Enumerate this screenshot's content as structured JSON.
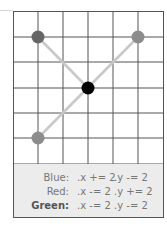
{
  "grid": {
    "columns": 6,
    "rows": 6,
    "line_color": "#555555",
    "background": "#ffffff"
  },
  "points": [
    {
      "name": "Blue",
      "col": 1,
      "row": 1,
      "color": "#666666"
    },
    {
      "name": "Red",
      "col": 5,
      "row": 1,
      "color": "#8c8c8c"
    },
    {
      "name": "Center",
      "col": 3,
      "row": 3,
      "color": "#000000"
    },
    {
      "name": "Green",
      "col": 1,
      "row": 5,
      "color": "#8c8c8c"
    }
  ],
  "connector_color": "#c8c8c8",
  "legend": {
    "rows": [
      {
        "name": "Blue:",
        "x_op": ".x += 2",
        "y_op": ".y -= 2"
      },
      {
        "name": "Red:",
        "x_op": ".x -= 2",
        "y_op": ".y += 2"
      },
      {
        "name": "Green:",
        "x_op": ".x -= 2",
        "y_op": ".y -= 2"
      }
    ]
  }
}
